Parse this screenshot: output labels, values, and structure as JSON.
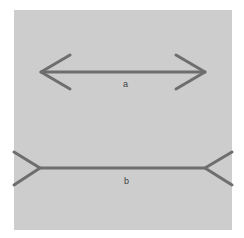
{
  "figure": {
    "background_color": "#cdcdcd",
    "line_color": "#707070",
    "lines": [
      {
        "label": "a",
        "style": "arrowheads-inward",
        "y": 72,
        "x_start": 41,
        "x_end": 205
      },
      {
        "label": "b",
        "style": "fins-outward",
        "y": 168,
        "x_start": 40,
        "x_end": 205
      }
    ]
  }
}
